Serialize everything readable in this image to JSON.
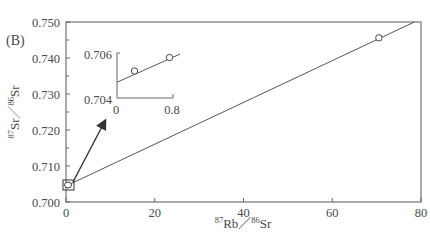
{
  "panel_label": "(B)",
  "chart_data": {
    "type": "scatter",
    "title": "",
    "xlabel": "87Rb/86Sr",
    "ylabel": "87Sr/86Sr",
    "xlabel_parts": {
      "sup1": "87",
      "base1": "Rb",
      "sep": "／",
      "sup2": "86",
      "base2": "Sr"
    },
    "ylabel_parts": {
      "sup1": "87",
      "base1": "Sr",
      "sep": "／",
      "sup2": "86",
      "base2": "Sr"
    },
    "xlim": [
      0,
      80
    ],
    "ylim": [
      0.7,
      0.75
    ],
    "xticks": [
      0,
      20,
      40,
      60,
      80
    ],
    "xtick_labels": [
      "0",
      "20",
      "40",
      "60",
      "80"
    ],
    "yticks": [
      0.7,
      0.71,
      0.72,
      0.73,
      0.74,
      0.75
    ],
    "ytick_labels": [
      "0.700",
      "0.710",
      "0.720",
      "0.730",
      "0.740",
      "0.750"
    ],
    "y_minor_ticks": [
      0.705,
      0.715,
      0.725,
      0.735,
      0.745
    ],
    "grid": false,
    "legend": null,
    "series": [
      {
        "name": "samples",
        "marker": "open-circle",
        "x": [
          0.25,
          0.75,
          70.5
        ],
        "y": [
          0.7052,
          0.7058,
          0.7456
        ]
      }
    ],
    "isochron": {
      "type": "line",
      "x": [
        0,
        78.5
      ],
      "y": [
        0.7047,
        0.75
      ]
    },
    "annotations": [
      {
        "type": "box",
        "label": "zoom region near origin",
        "x": [
          0,
          0.8
        ],
        "y": [
          0.704,
          0.706
        ]
      },
      {
        "type": "arrow",
        "label": "points to inset"
      }
    ],
    "inset": {
      "xlim": [
        0,
        0.8
      ],
      "ylim": [
        0.704,
        0.706
      ],
      "xtick_labels": [
        "0",
        "0.8"
      ],
      "ytick_labels": [
        "0.704",
        "0.706"
      ],
      "points": {
        "x": [
          0.25,
          0.75
        ],
        "y": [
          0.7052,
          0.7058
        ]
      },
      "line": {
        "x": [
          0,
          0.9
        ],
        "y": [
          0.7047,
          0.70595
        ]
      }
    }
  }
}
